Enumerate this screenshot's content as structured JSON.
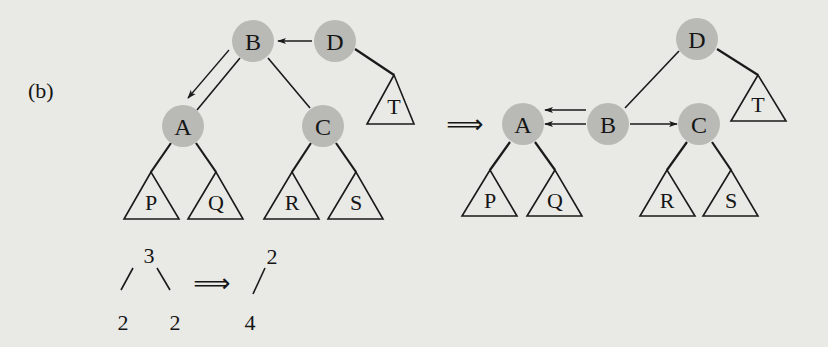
{
  "figure": {
    "panel_label": "(b)",
    "implies_symbol": "⟹",
    "colors": {
      "background": "#e9e9e6",
      "node_fill": "#b9b9b6",
      "stroke": "#1a1a1a"
    }
  },
  "before_tree": {
    "nodes": [
      {
        "id": "B",
        "label": "B"
      },
      {
        "id": "D",
        "label": "D"
      },
      {
        "id": "A",
        "label": "A"
      },
      {
        "id": "C",
        "label": "C"
      }
    ],
    "subtrees": [
      {
        "id": "P",
        "label": "P"
      },
      {
        "id": "Q",
        "label": "Q"
      },
      {
        "id": "R",
        "label": "R"
      },
      {
        "id": "S",
        "label": "S"
      },
      {
        "id": "T",
        "label": "T"
      }
    ],
    "edges": [
      {
        "from": "B",
        "to": "A"
      },
      {
        "from": "B",
        "to": "C"
      },
      {
        "from": "D",
        "to": "T"
      },
      {
        "from": "A",
        "to": "P"
      },
      {
        "from": "A",
        "to": "Q"
      },
      {
        "from": "C",
        "to": "R"
      },
      {
        "from": "C",
        "to": "S"
      }
    ],
    "pointers": [
      {
        "from": "D",
        "to": "B"
      },
      {
        "from": "B",
        "to": "A"
      }
    ]
  },
  "after_tree": {
    "nodes": [
      {
        "id": "D",
        "label": "D"
      },
      {
        "id": "A",
        "label": "A"
      },
      {
        "id": "B",
        "label": "B"
      },
      {
        "id": "C",
        "label": "C"
      }
    ],
    "subtrees": [
      {
        "id": "P",
        "label": "P"
      },
      {
        "id": "Q",
        "label": "Q"
      },
      {
        "id": "R",
        "label": "R"
      },
      {
        "id": "S",
        "label": "S"
      },
      {
        "id": "T",
        "label": "T"
      }
    ],
    "edges": [
      {
        "from": "D",
        "to": "B"
      },
      {
        "from": "D",
        "to": "T"
      },
      {
        "from": "A",
        "to": "P"
      },
      {
        "from": "A",
        "to": "Q"
      },
      {
        "from": "C",
        "to": "R"
      },
      {
        "from": "C",
        "to": "S"
      }
    ],
    "pointers": [
      {
        "from": "B",
        "to": "A"
      },
      {
        "from": "B",
        "to": "A"
      },
      {
        "from": "B",
        "to": "C"
      }
    ]
  },
  "degree_annotation": {
    "before": {
      "root": "3",
      "left_child": "2",
      "right_child": "2"
    },
    "after": {
      "root": "2",
      "child": "4"
    }
  }
}
